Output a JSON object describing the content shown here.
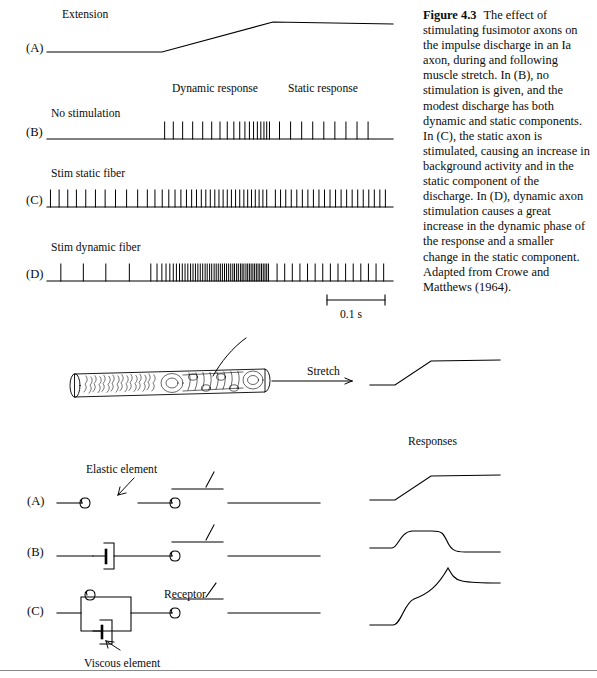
{
  "figure": {
    "label": "Figure 4.3",
    "caption": "The effect of stimulating fusimotor axons on the impulse discharge in an Ia axon, during and following muscle stretch. In (B), no stimulation is given, and the modest discharge has both dynamic and static components. In (C), the static axon is stimulated, causing an increase in background activity and in the static component of the discharge. In (D), dynamic axon stimulation causes a great increase in the dynamic phase of the response and a smaller change in the static component. Adapted from Crowe and Matthews (1964)."
  },
  "top_panel": {
    "traces": [
      {
        "letter": "(A)",
        "title": "Extension",
        "kind": "ramp"
      },
      {
        "letter": "(B)",
        "title": "No stimulation",
        "kind": "spike-train"
      },
      {
        "letter": "(C)",
        "title": "Stim static fiber",
        "kind": "spike-train"
      },
      {
        "letter": "(D)",
        "title": "Stim dynamic fiber",
        "kind": "spike-train"
      }
    ],
    "phase_labels": [
      {
        "text": "Dynamic response"
      },
      {
        "text": "Static response"
      }
    ],
    "scale_bar": {
      "text": "0.1 s"
    }
  },
  "bottom_panel": {
    "spindle": {
      "stretch_label": "Stretch"
    },
    "responses_heading": "Responses",
    "models": [
      {
        "letter": "(A)",
        "kind": "series-springs"
      },
      {
        "letter": "(B)",
        "kind": "dashpot-spring"
      },
      {
        "letter": "(C)",
        "kind": "voigt-spring"
      }
    ],
    "annotations": [
      {
        "text": "Elastic element"
      },
      {
        "text": "Receptor"
      },
      {
        "text": "Viscous element"
      }
    ]
  },
  "chart_data": {
    "type": "line",
    "xlabel": "time",
    "ylabel": "",
    "scale_bar": "0.1 s",
    "grid": false,
    "legend": "none",
    "traces": [
      {
        "name": "(A) Extension",
        "type": "line",
        "points": [
          [
            0,
            0
          ],
          [
            0.33,
            0
          ],
          [
            0.63,
            1.0
          ],
          [
            1.0,
            1.0
          ]
        ],
        "note": "muscle length ramp: hold, stretch, hold"
      },
      {
        "name": "(B) No stimulation",
        "type": "spike-train",
        "dynamic_spikes": [
          0.34,
          0.365,
          0.392,
          0.421,
          0.45,
          0.476,
          0.5,
          0.521,
          0.54,
          0.557,
          0.572,
          0.585,
          0.597,
          0.608,
          0.618,
          0.627,
          0.635,
          0.643
        ],
        "static_spikes": [
          0.672,
          0.704,
          0.736,
          0.768,
          0.8,
          0.832,
          0.864,
          0.896,
          0.928
        ],
        "baseline_spikes": []
      },
      {
        "name": "(C) Stim static fiber",
        "type": "spike-train",
        "baseline_spikes": [
          0.01,
          0.035,
          0.06,
          0.085,
          0.112,
          0.14,
          0.168,
          0.198,
          0.23,
          0.262
        ],
        "dynamic_spikes": [
          0.29,
          0.312,
          0.333,
          0.352,
          0.37,
          0.387,
          0.403,
          0.418,
          0.432,
          0.446,
          0.459,
          0.472,
          0.485,
          0.497,
          0.509,
          0.521,
          0.533,
          0.545,
          0.557,
          0.569,
          0.58,
          0.591,
          0.602,
          0.613,
          0.624,
          0.635
        ],
        "static_spikes": [
          0.66,
          0.675,
          0.69,
          0.706,
          0.722,
          0.738,
          0.754,
          0.77,
          0.786,
          0.802,
          0.818,
          0.834,
          0.85,
          0.866,
          0.882,
          0.898,
          0.914,
          0.93,
          0.946,
          0.962,
          0.978
        ]
      },
      {
        "name": "(D) Stim dynamic fiber",
        "type": "spike-train",
        "baseline_spikes": [
          0.04,
          0.105,
          0.17,
          0.238
        ],
        "dynamic_spikes": [
          0.3,
          0.318,
          0.332,
          0.344,
          0.355,
          0.365,
          0.374,
          0.383,
          0.391,
          0.399,
          0.407,
          0.415,
          0.422,
          0.429,
          0.436,
          0.443,
          0.45,
          0.457,
          0.463,
          0.47,
          0.476,
          0.483,
          0.489,
          0.495,
          0.501,
          0.507,
          0.513,
          0.519,
          0.525,
          0.531,
          0.537,
          0.542,
          0.548,
          0.553,
          0.559,
          0.564,
          0.569,
          0.575,
          0.58,
          0.585,
          0.59,
          0.595,
          0.6,
          0.605,
          0.61,
          0.615,
          0.62,
          0.625,
          0.63,
          0.635,
          0.64
        ],
        "static_spikes": [
          0.665,
          0.687,
          0.709,
          0.731,
          0.753,
          0.775,
          0.797,
          0.819,
          0.841,
          0.863,
          0.885,
          0.907,
          0.929,
          0.951,
          0.973
        ]
      }
    ],
    "model_responses": [
      {
        "name": "spindle stretch",
        "type": "line",
        "points": [
          [
            0,
            0
          ],
          [
            0.26,
            0
          ],
          [
            0.56,
            1.0
          ],
          [
            1.0,
            1.0
          ]
        ]
      },
      {
        "name": "(A) response",
        "type": "line",
        "points": [
          [
            0,
            0
          ],
          [
            0.26,
            0
          ],
          [
            0.56,
            1.0
          ],
          [
            1.0,
            1.0
          ]
        ]
      },
      {
        "name": "(B) response",
        "type": "line",
        "points": [
          [
            0,
            0
          ],
          [
            0.22,
            0
          ],
          [
            0.3,
            1.0
          ],
          [
            0.6,
            1.0
          ],
          [
            0.68,
            0.1
          ],
          [
            1.0,
            0.1
          ]
        ]
      },
      {
        "name": "(C) response",
        "type": "line",
        "points": [
          [
            0,
            0
          ],
          [
            0.22,
            0
          ],
          [
            0.3,
            0.55
          ],
          [
            0.58,
            0.95
          ],
          [
            0.62,
            1.0
          ],
          [
            0.7,
            0.35
          ],
          [
            1.0,
            0.32
          ]
        ]
      }
    ]
  }
}
